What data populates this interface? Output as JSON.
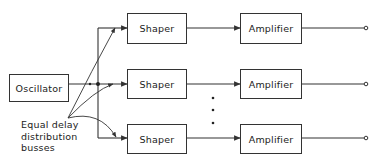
{
  "diagram": {
    "oscillator": {
      "label": "Oscillator"
    },
    "rows": [
      {
        "shaper": "Shaper",
        "amplifier": "Amplifier"
      },
      {
        "shaper": "Shaper",
        "amplifier": "Amplifier"
      },
      {
        "shaper": "Shaper",
        "amplifier": "Amplifier"
      }
    ],
    "annotation": {
      "line1": "Equal delay",
      "line2": "distribution",
      "line3": "busses"
    },
    "continuation": "⋮",
    "colors": {
      "stroke": "#333333",
      "background": "#ffffff"
    }
  }
}
